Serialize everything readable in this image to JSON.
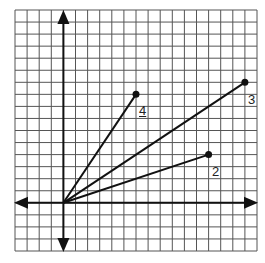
{
  "diagram": {
    "type": "coordinate-grid-vectors",
    "grid": {
      "x_min": -4,
      "x_max": 16,
      "y_min": -4,
      "y_max": 16,
      "cell_count": 20,
      "line_color": "#555555"
    },
    "axes": {
      "color": "#111111",
      "arrows": [
        "left",
        "right",
        "up",
        "down"
      ]
    },
    "origin": [
      0,
      0
    ],
    "vectors": [
      {
        "label": "4",
        "end": [
          6,
          9
        ]
      },
      {
        "label": "3",
        "end": [
          15,
          10
        ]
      },
      {
        "label": "2",
        "end": [
          12,
          4
        ]
      }
    ]
  }
}
